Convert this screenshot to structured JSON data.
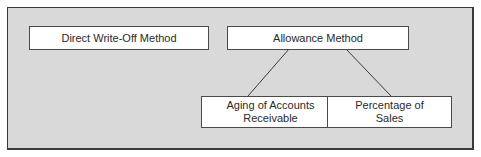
{
  "diagram": {
    "type": "hierarchy",
    "colors": {
      "background": "#d9d9d9",
      "box_fill": "#ffffff",
      "border": "#4a4a4a",
      "text": "#2a2a2a"
    },
    "nodes": {
      "direct": {
        "label": "Direct Write-Off Method"
      },
      "allowance": {
        "label": "Allowance Method"
      },
      "aging": {
        "line1": "Aging of Accounts",
        "line2": "Receivable"
      },
      "percentage": {
        "line1": "Percentage of",
        "line2": "Sales"
      }
    },
    "edges": [
      {
        "from": "Allowance Method",
        "to": "Aging of Accounts Receivable"
      },
      {
        "from": "Allowance Method",
        "to": "Percentage of Sales"
      }
    ]
  }
}
